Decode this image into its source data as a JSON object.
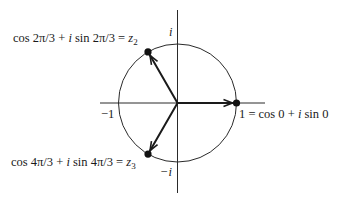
{
  "figure": {
    "axis_labels": {
      "pos_imag": "i",
      "neg_imag": "−i",
      "neg_real": "−1"
    },
    "points": [
      {
        "id": "z1",
        "angle_deg": 0,
        "label_parts": [
          "1 = cos 0 + ",
          "i",
          " sin 0"
        ]
      },
      {
        "id": "z2",
        "angle_deg": 120,
        "label_parts": [
          "cos 2π/3 + ",
          "i",
          " sin 2π/3 = ",
          "z",
          "2"
        ]
      },
      {
        "id": "z3",
        "angle_deg": 240,
        "label_parts": [
          "cos 4π/3 + ",
          "i",
          " sin 4π/3 = ",
          "z",
          "3"
        ]
      }
    ],
    "colors": {
      "ink": "#1a1a1a",
      "background": "#ffffff"
    }
  }
}
